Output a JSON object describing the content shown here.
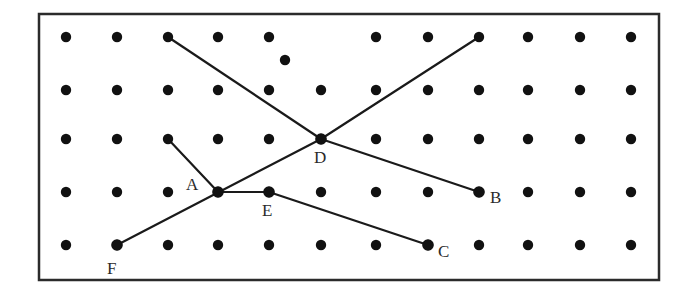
{
  "diagram": {
    "type": "dot-grid-geometry",
    "frame": {
      "x": 39,
      "y": 14,
      "width": 620,
      "height": 266,
      "stroke": "#2b2b2b",
      "stroke_width": 2.5
    },
    "colors": {
      "dot": "#111111",
      "line": "#1a1a1a",
      "label": "#2a2a2a"
    },
    "grid": {
      "columns_x": [
        66,
        117,
        168,
        218,
        269,
        321,
        376,
        428,
        479,
        528,
        580,
        631
      ],
      "rows_y": [
        37,
        90,
        139,
        192,
        245
      ],
      "dot_radius": 5.2,
      "missing_dots": [
        [
          321,
          37
        ]
      ],
      "extra_dots": [
        [
          285,
          60
        ]
      ]
    },
    "points": [
      {
        "name": "A",
        "x": 218,
        "y": 192,
        "label_x": 186,
        "label_y": 190
      },
      {
        "name": "B",
        "x": 479,
        "y": 192,
        "label_x": 490,
        "label_y": 203
      },
      {
        "name": "C",
        "x": 428,
        "y": 245,
        "label_x": 438,
        "label_y": 257
      },
      {
        "name": "D",
        "x": 321,
        "y": 139,
        "label_x": 314,
        "label_y": 163
      },
      {
        "name": "E",
        "x": 269,
        "y": 192,
        "label_x": 262,
        "label_y": 216
      },
      {
        "name": "F",
        "x": 117,
        "y": 245,
        "label_x": 107,
        "label_y": 274
      }
    ],
    "segments": [
      {
        "from": [
          168,
          37
        ],
        "to": [
          321,
          139
        ],
        "desc": "top-left dot to D"
      },
      {
        "from": [
          321,
          139
        ],
        "to": [
          479,
          37
        ],
        "desc": "D to top-right dot"
      },
      {
        "from": [
          321,
          139
        ],
        "to": [
          479,
          192
        ],
        "desc": "D to B"
      },
      {
        "from": [
          117,
          245
        ],
        "to": [
          321,
          139
        ],
        "desc": "F to D through A"
      },
      {
        "from": [
          168,
          139
        ],
        "to": [
          218,
          192
        ],
        "desc": "dot to A"
      },
      {
        "from": [
          218,
          192
        ],
        "to": [
          269,
          192
        ],
        "desc": "A to E"
      },
      {
        "from": [
          269,
          192
        ],
        "to": [
          428,
          245
        ],
        "desc": "E to C"
      }
    ]
  }
}
